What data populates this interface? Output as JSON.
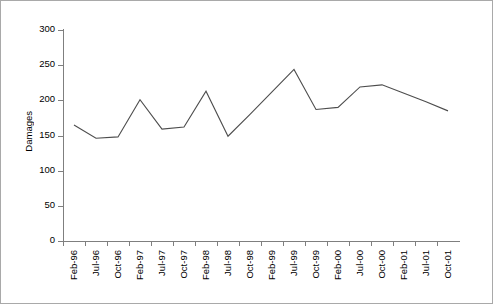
{
  "chart_data": {
    "type": "line",
    "title": "",
    "xlabel": "",
    "ylabel": "Damages",
    "ylim": [
      0,
      300
    ],
    "yticks": [
      0,
      50,
      100,
      150,
      200,
      250,
      300
    ],
    "grid": false,
    "legend": false,
    "categories": [
      "Feb-96",
      "Jul-96",
      "Oct-96",
      "Feb-97",
      "Jul-97",
      "Oct-97",
      "Feb-98",
      "Jul-98",
      "Oct-98",
      "Feb-99",
      "Jul-99",
      "Oct-99",
      "Feb-00",
      "Jul-00",
      "Oct-00",
      "Feb-01",
      "Jul-01",
      "Oct-01"
    ],
    "series": [
      {
        "name": "Damages",
        "values": [
          165,
          146,
          148,
          201,
          159,
          162,
          213,
          149,
          180,
          212,
          244,
          187,
          190,
          219,
          222,
          210,
          198,
          185
        ]
      }
    ]
  },
  "axis": {
    "y_title": "Damages"
  }
}
